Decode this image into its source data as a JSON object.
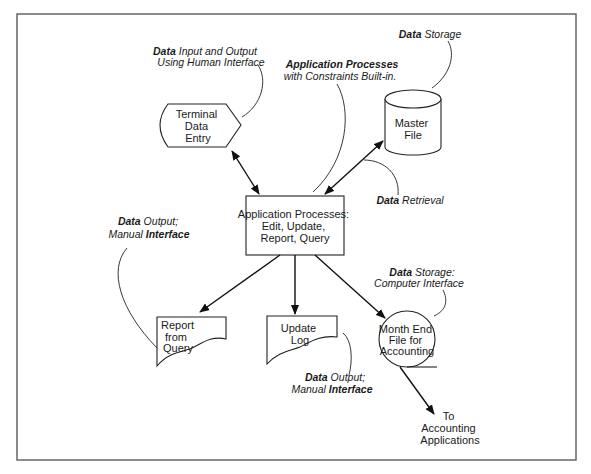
{
  "diagram": {
    "frame": {
      "border_color": "#666666"
    },
    "nodes": {
      "terminal": {
        "lines": [
          "Terminal",
          "Data",
          "Entry"
        ],
        "shape": "display"
      },
      "master_file": {
        "lines": [
          "Master",
          "File"
        ],
        "shape": "cylinder"
      },
      "process": {
        "lines": [
          "Application Processes:",
          "Edit, Update,",
          "Report, Query"
        ],
        "shape": "rectangle"
      },
      "report": {
        "lines": [
          "Report",
          "from",
          "Query"
        ],
        "shape": "document"
      },
      "update_log": {
        "lines": [
          "Update",
          "Log"
        ],
        "shape": "document"
      },
      "month_end": {
        "lines": [
          "Month End",
          "File for",
          "Accounting"
        ],
        "shape": "sequential-storage"
      },
      "to_accounting": {
        "lines": [
          "To",
          "Accounting",
          "Applications"
        ]
      }
    },
    "annotations": {
      "terminal_io": {
        "bold": "Data",
        "rest": " Input and Output",
        "line2": "Using Human Interface"
      },
      "app_processes": {
        "bold": "Application Processes",
        "line2": "with Constraints Built-in."
      },
      "data_storage": {
        "bold": "Data",
        "rest": " Storage"
      },
      "data_retrieval": {
        "bold": "Data",
        "rest": " Retrieval"
      },
      "report_output": {
        "bold": "Data",
        "rest": " Output;",
        "line2_italic": "Manual ",
        "line2_bold": "Interface"
      },
      "log_output": {
        "bold": "Data",
        "rest": " Output;",
        "line2_italic": "Manual ",
        "line2_bold": "Interface"
      },
      "storage_computer": {
        "bold": "Data",
        "rest": " Storage:",
        "line2": "Computer Interface"
      }
    },
    "edges": [
      {
        "from": "terminal",
        "to": "process",
        "type": "bidirectional"
      },
      {
        "from": "master_file",
        "to": "process",
        "type": "bidirectional"
      },
      {
        "from": "process",
        "to": "report",
        "type": "directed"
      },
      {
        "from": "process",
        "to": "update_log",
        "type": "directed"
      },
      {
        "from": "process",
        "to": "month_end",
        "type": "directed"
      },
      {
        "from": "month_end",
        "to": "to_accounting",
        "type": "directed"
      }
    ]
  }
}
